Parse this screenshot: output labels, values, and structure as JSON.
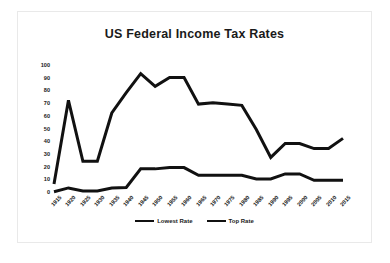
{
  "figure": {
    "title": "US Federal Income Tax Rates",
    "line_color": "#111111",
    "frame_color": "#e9e9e9",
    "background": "#ffffff"
  },
  "legend": {
    "position": "bottom-center",
    "items": [
      {
        "label": "Lowest Rate",
        "swatch": "solid-line-swatch"
      },
      {
        "label": "Top Rate",
        "swatch": "solid-line-swatch"
      }
    ]
  },
  "chart_data": {
    "type": "line",
    "title": "US Federal Income Tax Rates",
    "xlabel": "",
    "ylabel": "",
    "xlim": [
      1915,
      2015
    ],
    "ylim": [
      0,
      100
    ],
    "grid": false,
    "legend_position": "bottom-center",
    "categories": [
      "1915",
      "1920",
      "1925",
      "1930",
      "1935",
      "1940",
      "1945",
      "1950",
      "1955",
      "1960",
      "1965",
      "1970",
      "1975",
      "1980",
      "1985",
      "1990",
      "1995",
      "2000",
      "2005",
      "2010",
      "2015"
    ],
    "yticks": [
      "0",
      "10",
      "20",
      "30",
      "40",
      "50",
      "60",
      "70",
      "80",
      "90",
      "100"
    ],
    "series": [
      {
        "name": "Lowest Rate",
        "values": [
          1,
          4,
          1.5,
          1.5,
          4,
          4.4,
          19,
          19,
          20,
          20,
          14,
          14,
          14,
          14,
          11,
          11,
          15,
          15,
          10,
          10,
          10
        ]
      },
      {
        "name": "Top Rate",
        "values": [
          7,
          73,
          25,
          25,
          63,
          79,
          94,
          84,
          91,
          91,
          70,
          71,
          70,
          69,
          50,
          28,
          39,
          39,
          35,
          35,
          43
        ]
      }
    ]
  }
}
